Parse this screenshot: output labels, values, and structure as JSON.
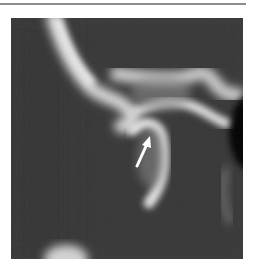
{
  "figure": {
    "annotation": {
      "type": "arrow",
      "color": "#ffffff"
    },
    "colors": {
      "background": "#ffffff",
      "rule": "#8c8c8c",
      "scan_background": "#3a3a3a",
      "bone": "#e8e8e8"
    }
  }
}
